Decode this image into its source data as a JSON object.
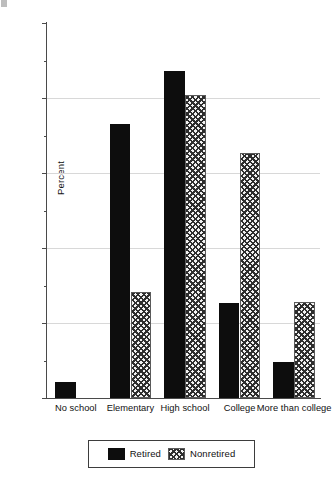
{
  "chart_data": {
    "type": "bar",
    "title": "",
    "subtitle": "",
    "xlabel": "",
    "ylabel": "Percent",
    "ylim": [
      0,
      50
    ],
    "ytick_values": [
      0,
      10,
      20,
      30,
      40,
      50
    ],
    "ytick_labels": [
      "0",
      "10",
      "20",
      "30",
      "40",
      "50"
    ],
    "yminor_tick_values": [
      5,
      15,
      25,
      35,
      45
    ],
    "grid": "horizontal-major-only",
    "legend_position": "below-axis-centered",
    "categories": [
      "No school",
      "Elementary",
      "High school",
      "College",
      "More than college"
    ],
    "series": [
      {
        "name": "Retired",
        "pattern": "solid-black",
        "color": "#0d0d0d",
        "values": [
          2.2,
          36.6,
          43.6,
          12.7,
          4.8
        ]
      },
      {
        "name": "Nonretired",
        "pattern": "checkered",
        "color": "#f2f2f2",
        "values": [
          0,
          14.2,
          40.4,
          32.7,
          12.8
        ]
      }
    ]
  },
  "axis": {
    "y_label": "Percent"
  },
  "legend": {
    "entries": [
      {
        "label": "Retired",
        "swatch": "solid-black-swatch"
      },
      {
        "label": "Nonretired",
        "swatch": "checkered-swatch"
      }
    ]
  }
}
